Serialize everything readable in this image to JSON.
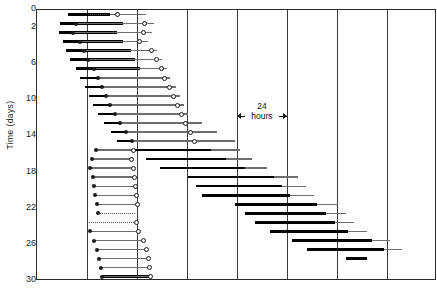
{
  "chart": {
    "type": "actogram",
    "ylabel": "Time (days)",
    "ytick_labels": [
      "0",
      "2",
      "6",
      "10",
      "14",
      "18",
      "22",
      "26",
      "30"
    ],
    "annotation": {
      "value": "24",
      "unit": "hours"
    }
  },
  "chart_data": {
    "type": "bar",
    "title": "",
    "subtitle": "",
    "xlabel": "",
    "ylabel": "Time (days)",
    "xlim": [
      0,
      8
    ],
    "ylim": [
      0,
      30
    ],
    "ylim_inverted": true,
    "grid": true,
    "legend": null,
    "axis_note": "x axis unlabeled; vertical gridlines every 24 hours",
    "yticks": [
      0,
      2,
      6,
      10,
      14,
      18,
      22,
      26,
      30
    ],
    "ytick_labels": [
      "0",
      "2",
      "6",
      "10",
      "14",
      "18",
      "22",
      "26",
      "30"
    ],
    "annotations": [
      {
        "text": "24 hours",
        "type": "double-arrow-span",
        "x_start": 4.0,
        "x_end": 5.0,
        "y": 11.0
      }
    ],
    "series": [
      {
        "name": "activity-bout",
        "style": "thick-black-bar"
      },
      {
        "name": "activity-tail",
        "style": "thin-gray-line"
      },
      {
        "name": "onset-marker",
        "style": "filled-circle"
      },
      {
        "name": "offset-marker",
        "style": "open-circle"
      }
    ],
    "records": [
      {
        "day": 0,
        "bar": [
          0.62,
          1.46
        ],
        "tail": [
          1.46,
          2.17
        ],
        "dashed": [
          1.02,
          1.6
        ],
        "circ": 1.6
      },
      {
        "day": 1,
        "bar": [
          0.46,
          1.72
        ],
        "tail": [
          1.72,
          2.34
        ],
        "dot": 0.78,
        "circ": 2.14
      },
      {
        "day": 2,
        "bar": [
          0.44,
          1.6
        ],
        "tail": [
          1.6,
          2.3
        ],
        "dot": 0.72,
        "circ": 2.12
      },
      {
        "day": 3,
        "bar": [
          0.52,
          1.72
        ],
        "tail": [
          1.72,
          2.22
        ],
        "dot": 0.86,
        "circ": 2.05
      },
      {
        "day": 4,
        "bar": [
          0.58,
          1.88
        ],
        "tail": [
          1.88,
          2.4
        ],
        "dot": 0.94,
        "circ": 2.28
      },
      {
        "day": 5,
        "bar": [
          0.66,
          1.96
        ],
        "tail": [
          1.96,
          2.5
        ],
        "dot": 1.02,
        "circ": 2.38
      },
      {
        "day": 6,
        "bar": [
          0.78,
          2.06
        ],
        "tail": [
          2.06,
          2.6
        ],
        "dot": 1.14,
        "circ": 2.48
      },
      {
        "day": 7,
        "bar": [
          0.86,
          2.14
        ],
        "tail": [
          2.14,
          2.66
        ],
        "dot": 1.22,
        "circ": 2.54
      },
      {
        "day": 8,
        "bar": [
          0.96,
          2.22
        ],
        "tail": [
          2.22,
          2.78
        ],
        "dot": 1.3,
        "circ": 2.64
      },
      {
        "day": 9,
        "bar": [
          1.04,
          2.3
        ],
        "tail": [
          2.3,
          2.86
        ],
        "dot": 1.38,
        "circ": 2.72
      },
      {
        "day": 10,
        "bar": [
          1.12,
          2.38
        ],
        "tail": [
          2.38,
          2.94
        ],
        "dot": 1.46,
        "circ": 2.8
      },
      {
        "day": 11,
        "bar": [
          1.22,
          2.46
        ],
        "tail": [
          2.46,
          3.02
        ],
        "dot": 1.56,
        "circ": 2.88
      },
      {
        "day": 12,
        "bar": [
          1.34,
          2.58
        ],
        "tail": [
          2.58,
          3.3
        ],
        "dot": 1.66,
        "circ": 2.96
      },
      {
        "day": 13,
        "bar": [
          1.48,
          2.72
        ],
        "tail": [
          2.72,
          3.6
        ],
        "dot": 1.78,
        "circ": 3.06
      },
      {
        "day": 14,
        "bar": [
          1.6,
          2.82
        ],
        "tail": [
          2.82,
          3.96
        ],
        "dot": 1.9,
        "circ": 3.14
      },
      {
        "day": 15,
        "bar": [
          1.96,
          3.48
        ],
        "tail": [
          3.48,
          4.06
        ],
        "dot": 1.18,
        "circ": 1.92
      },
      {
        "day": 16,
        "bar": [
          2.18,
          3.78
        ],
        "tail": [
          3.78,
          4.3
        ],
        "dot": 1.1,
        "circ": 1.88
      },
      {
        "day": 17,
        "bar": [
          2.46,
          4.16
        ],
        "tail": [
          4.16,
          4.6
        ],
        "dot": 1.06,
        "circ": 1.92
      },
      {
        "day": 18,
        "bar": [
          3.02,
          4.74
        ],
        "tail": [
          4.74,
          5.22
        ],
        "dot": 1.12,
        "circ": 1.94
      },
      {
        "day": 19,
        "bar": [
          3.18,
          4.9
        ],
        "tail": [
          4.9,
          5.38
        ],
        "dot": 1.14,
        "circ": 1.96
      },
      {
        "day": 20,
        "bar": [
          3.3,
          5.06
        ],
        "tail": [
          5.06,
          5.54
        ],
        "dot": 1.16,
        "circ": 1.98
      },
      {
        "day": 21,
        "bar": [
          3.96,
          5.6
        ],
        "tail": [
          5.6,
          6.02
        ],
        "dot": 1.2,
        "circ": 2.0
      },
      {
        "day": 22,
        "bar": [
          4.16,
          5.78
        ],
        "tail": [
          5.78,
          6.18
        ],
        "dashed": [
          1.22,
          1.96
        ],
        "dot": 1.22
      },
      {
        "day": 23,
        "bar": [
          4.36,
          5.96
        ],
        "tail": [
          5.96,
          6.34
        ],
        "dashed": [
          1.0,
          1.98
        ],
        "circ": 1.98
      },
      {
        "day": 24,
        "bar": [
          4.66,
          6.22
        ],
        "tail": [
          6.22,
          6.6
        ],
        "dot": 1.06,
        "circ": 2.02
      },
      {
        "day": 25,
        "bar": [
          5.1,
          6.7
        ],
        "tail": [
          6.7,
          7.06
        ],
        "dot": 1.14,
        "circ": 2.12
      },
      {
        "day": 26,
        "bar": [
          5.4,
          6.94
        ],
        "tail": [
          6.94,
          7.3
        ],
        "dot": 1.2,
        "circ": 2.18
      },
      {
        "day": 27,
        "bar": [
          6.18,
          6.6
        ],
        "tail": null,
        "dot": 1.24,
        "circ": 2.22
      },
      {
        "day": 28,
        "bar": null,
        "tail": null,
        "dot": 1.28,
        "circ": 2.24
      },
      {
        "day": 29,
        "bar": [
          1.3,
          2.26
        ],
        "tail": null,
        "dot": 1.3,
        "circ": 2.26
      }
    ]
  }
}
